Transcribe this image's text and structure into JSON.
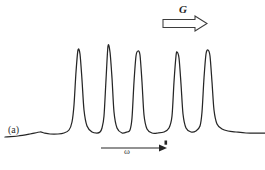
{
  "figure": {
    "panel_label": "(a)",
    "gradient_label": "G",
    "axis_label": "ω",
    "line_color": "#262626",
    "background_color": "#ffffff",
    "arrow_outline_color": "#3a3a3a"
  },
  "chart_data": {
    "type": "line",
    "title": "",
    "subtitle": "",
    "xlabel": "ω",
    "ylabel": "",
    "grid": false,
    "legend": null,
    "axis_ranges": {
      "x": [
        0,
        265
      ],
      "y": [
        0,
        170
      ]
    },
    "annotations": [
      {
        "name": "panel-label",
        "text": "(a)",
        "x": 14,
        "y": 134
      },
      {
        "name": "gradient-arrow-label",
        "text": "G",
        "x": 185,
        "y": 13
      },
      {
        "name": "frequency-axis-label",
        "text": "ω",
        "x": 130,
        "y": 156
      }
    ],
    "baseline_y": 133,
    "peaks": [
      {
        "index": 1,
        "center_x": 78,
        "apex_y": 50,
        "height": 83,
        "half_width": 7
      },
      {
        "index": 2,
        "center_x": 108,
        "apex_y": 46,
        "height": 87,
        "half_width": 7
      },
      {
        "index": 3,
        "center_x": 138,
        "apex_y": 51,
        "height": 82,
        "half_width": 7
      },
      {
        "index": 4,
        "center_x": 177,
        "apex_y": 52,
        "height": 81,
        "half_width": 7
      },
      {
        "index": 5,
        "center_x": 208,
        "apex_y": 50,
        "height": 83,
        "half_width": 7
      }
    ],
    "series": [
      {
        "name": "spectrum-trace",
        "x": [
          5,
          18,
          30,
          40,
          44,
          50,
          58,
          64,
          69,
          72,
          74,
          76,
          78,
          80,
          82,
          84,
          87,
          92,
          97,
          100,
          102,
          104,
          106,
          108,
          110,
          112,
          114,
          117,
          122,
          127,
          130,
          132,
          134,
          136,
          138,
          140,
          142,
          144,
          147,
          152,
          158,
          164,
          169,
          172,
          174,
          176,
          177,
          179,
          181,
          183,
          186,
          191,
          196,
          200,
          202,
          204,
          206,
          208,
          210,
          212,
          214,
          217,
          222,
          228,
          236,
          246,
          258,
          265
        ],
        "y": [
          137,
          136,
          134,
          132,
          133,
          134,
          134,
          133,
          130,
          122,
          105,
          72,
          50,
          54,
          80,
          110,
          126,
          132,
          133,
          132,
          128,
          116,
          80,
          46,
          52,
          78,
          112,
          128,
          133,
          132,
          130,
          118,
          82,
          56,
          51,
          55,
          82,
          115,
          129,
          133,
          133,
          132,
          128,
          116,
          82,
          56,
          52,
          58,
          84,
          114,
          128,
          132,
          131,
          126,
          112,
          78,
          54,
          50,
          56,
          82,
          110,
          124,
          129,
          131,
          132,
          133,
          133,
          133
        ]
      }
    ]
  }
}
